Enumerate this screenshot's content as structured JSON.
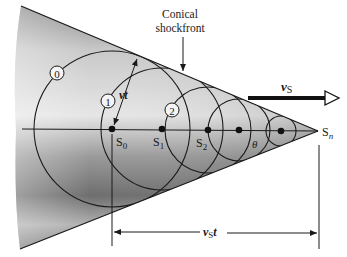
{
  "diagram": {
    "title_label_line1": "Conical",
    "title_label_line2": "shockfront",
    "velocity_label": "v",
    "velocity_subscript": "S",
    "wave_distance_label": "vt",
    "source_distance_label": "v",
    "source_distance_subscript": "S",
    "source_distance_suffix": "t",
    "angle_label": "θ",
    "wavefront_labels": [
      "0",
      "1",
      "2"
    ],
    "source_positions": [
      {
        "label": "S",
        "sub": "0"
      },
      {
        "label": "S",
        "sub": "1"
      },
      {
        "label": "S",
        "sub": "2"
      },
      {
        "label": "",
        "sub": ""
      },
      {
        "label": "",
        "sub": ""
      }
    ],
    "apex_label": "S",
    "apex_subscript": "n",
    "colors": {
      "line": "#1a1a1a",
      "cone_light": "#f2f2f2",
      "cone_dark": "#5a5a5a",
      "background": "#ffffff"
    }
  }
}
